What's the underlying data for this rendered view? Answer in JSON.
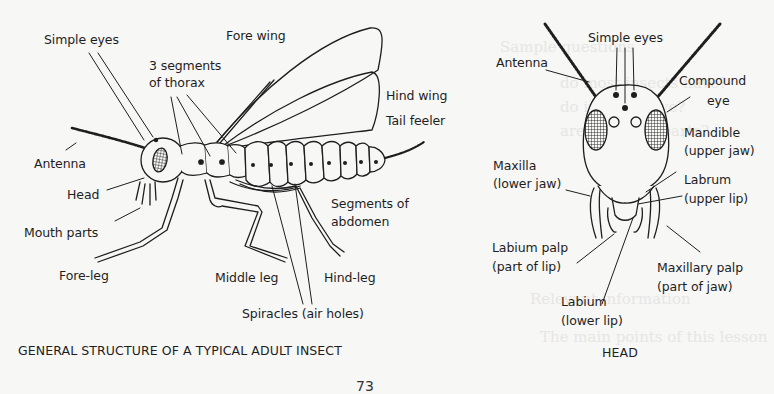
{
  "background_color": "#f7f7f6",
  "ink_color": "#1e1e1e",
  "figure_left": {
    "caption": "GENERAL STRUCTURE OF A TYPICAL ADULT INSECT",
    "labels": {
      "simple_eyes": "Simple eyes",
      "fore_wing": "Fore wing",
      "thorax_line1": "3 segments",
      "thorax_line2": "of thorax",
      "hind_wing": "Hind wing",
      "tail_feeler": "Tail feeler",
      "antenna": "Antenna",
      "head": "Head",
      "mouth_parts": "Mouth parts",
      "abdomen_line1": "Segments of",
      "abdomen_line2": "abdomen",
      "fore_leg": "Fore-leg",
      "middle_leg": "Middle leg",
      "hind_leg": "Hind-leg",
      "spiracles": "Spiracles (air holes)"
    }
  },
  "figure_right": {
    "caption": "HEAD",
    "labels": {
      "simple_eyes": "Simple eyes",
      "antenna": "Antenna",
      "compound_eye_line1": "Compound",
      "compound_eye_line2": "eye",
      "mandible_line1": "Mandible",
      "mandible_line2": "(upper jaw)",
      "maxilla_line1": "Maxilla",
      "maxilla_line2": "(lower jaw)",
      "labrum_line1": "Labrum",
      "labrum_line2": "(upper lip)",
      "labium_palp_line1": "Labium palp",
      "labium_palp_line2": "(part of lip)",
      "maxillary_palp_line1": "Maxillary palp",
      "maxillary_palp_line2": "(part of jaw)",
      "labium_line1": "Labium",
      "labium_line2": "(lower lip)"
    }
  },
  "bleed_through": {
    "line1": "Sample questions",
    "line2": "do most insects have?",
    "line3": "do insects have?",
    "line4": "are the main parts?",
    "line5": "Relevant information",
    "line6": "The main points of this lesson"
  },
  "page_number": "73"
}
